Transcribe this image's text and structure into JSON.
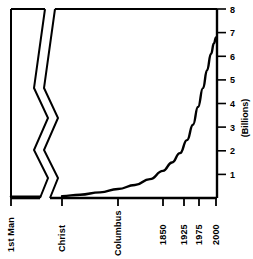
{
  "chart_data": {
    "type": "line",
    "title": "",
    "subtitle": "",
    "xlabel": "",
    "ylabel": "(Billions)",
    "ylim": [
      0,
      8
    ],
    "grid": false,
    "legend": null,
    "axis_break": true,
    "axis_break_note": "zigzag break on time axis between '1st Man' and 'Christ'",
    "y_ticks": [
      {
        "value": 8,
        "label": "8"
      },
      {
        "value": 7,
        "label": "7"
      },
      {
        "value": 6,
        "label": "6"
      },
      {
        "value": 5,
        "label": "5"
      },
      {
        "value": 4,
        "label": "4"
      },
      {
        "value": 3,
        "label": "3"
      },
      {
        "value": 2,
        "label": "2"
      },
      {
        "value": 1,
        "label": "1"
      }
    ],
    "x_ticks": [
      {
        "label": "1st Man",
        "pos": 11
      },
      {
        "label": "Christ",
        "pos": 62
      },
      {
        "label": "Columbus",
        "pos": 118
      },
      {
        "label": "1850",
        "pos": 163
      },
      {
        "label": "1925",
        "pos": 184
      },
      {
        "label": "1975",
        "pos": 199
      },
      {
        "label": "2000",
        "pos": 216
      }
    ],
    "categories": [
      "1st Man",
      "Christ",
      "Columbus",
      "1850",
      "1925",
      "1975",
      "2000"
    ],
    "values": [
      0.0,
      0.2,
      0.45,
      1.2,
      2.0,
      4.1,
      6.8
    ],
    "series": [
      {
        "name": "World Population",
        "values": [
          0.0,
          0.2,
          0.45,
          1.2,
          2.0,
          4.1,
          6.8
        ]
      }
    ],
    "curve_points": [
      {
        "x": 62,
        "y": 0.08
      },
      {
        "x": 80,
        "y": 0.14
      },
      {
        "x": 100,
        "y": 0.24
      },
      {
        "x": 118,
        "y": 0.38
      },
      {
        "x": 135,
        "y": 0.55
      },
      {
        "x": 150,
        "y": 0.8
      },
      {
        "x": 163,
        "y": 1.15
      },
      {
        "x": 172,
        "y": 1.5
      },
      {
        "x": 180,
        "y": 1.9
      },
      {
        "x": 187,
        "y": 2.45
      },
      {
        "x": 193,
        "y": 3.1
      },
      {
        "x": 198,
        "y": 3.85
      },
      {
        "x": 203,
        "y": 4.65
      },
      {
        "x": 207,
        "y": 5.4
      },
      {
        "x": 211,
        "y": 6.1
      },
      {
        "x": 214,
        "y": 6.55
      },
      {
        "x": 216,
        "y": 6.8
      }
    ],
    "colors": {
      "line": "#000000",
      "axis": "#000000",
      "background": "#ffffff"
    }
  }
}
